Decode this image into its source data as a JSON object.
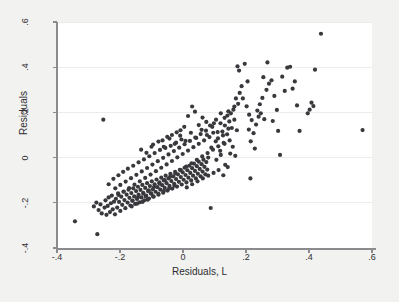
{
  "chart_data": {
    "type": "scatter",
    "title": "",
    "xlabel": "Residuals, L",
    "ylabel": "Residuals",
    "xlim": [
      -0.4,
      0.6
    ],
    "ylim": [
      -0.4,
      0.6
    ],
    "xticks": [
      -0.4,
      -0.2,
      0,
      0.2,
      0.4,
      0.6
    ],
    "xticklabels": [
      "-.4",
      "-.2",
      "0",
      ".2",
      ".4",
      ".6"
    ],
    "yticks": [
      -0.4,
      -0.2,
      0,
      0.2,
      0.4,
      0.6
    ],
    "yticklabels": [
      "-.4",
      "-.2",
      "0",
      ".2",
      ".4",
      ".6"
    ],
    "grid": "horizontal-faint",
    "legend": null,
    "marker_color": "#39393d",
    "marker_size_px": 4.2,
    "n_points": 296,
    "points": [
      [
        -0.343,
        -0.282
      ],
      [
        -0.272,
        -0.339
      ],
      [
        -0.253,
        0.168
      ],
      [
        -0.283,
        -0.216
      ],
      [
        -0.275,
        -0.199
      ],
      [
        -0.268,
        -0.232
      ],
      [
        -0.262,
        -0.207
      ],
      [
        -0.258,
        -0.247
      ],
      [
        -0.249,
        -0.221
      ],
      [
        -0.246,
        -0.189
      ],
      [
        -0.243,
        -0.253
      ],
      [
        -0.239,
        -0.214
      ],
      [
        -0.236,
        -0.176
      ],
      [
        -0.232,
        -0.241
      ],
      [
        -0.229,
        -0.202
      ],
      [
        -0.226,
        -0.168
      ],
      [
        -0.223,
        -0.229
      ],
      [
        -0.219,
        -0.195
      ],
      [
        -0.216,
        -0.251
      ],
      [
        -0.213,
        -0.182
      ],
      [
        -0.209,
        -0.221
      ],
      [
        -0.206,
        -0.158
      ],
      [
        -0.203,
        -0.196
      ],
      [
        -0.199,
        -0.236
      ],
      [
        -0.196,
        -0.173
      ],
      [
        -0.193,
        -0.209
      ],
      [
        -0.189,
        -0.151
      ],
      [
        -0.186,
        -0.188
      ],
      [
        -0.183,
        -0.224
      ],
      [
        -0.179,
        -0.164
      ],
      [
        -0.176,
        -0.199
      ],
      [
        -0.173,
        -0.142
      ],
      [
        -0.17,
        -0.178
      ],
      [
        -0.167,
        -0.212
      ],
      [
        -0.164,
        -0.157
      ],
      [
        -0.161,
        -0.191
      ],
      [
        -0.158,
        -0.136
      ],
      [
        -0.155,
        -0.172
      ],
      [
        -0.152,
        -0.205
      ],
      [
        -0.149,
        -0.148
      ],
      [
        -0.146,
        -0.183
      ],
      [
        -0.143,
        -0.129
      ],
      [
        -0.141,
        -0.164
      ],
      [
        -0.138,
        -0.198
      ],
      [
        -0.135,
        -0.143
      ],
      [
        -0.132,
        -0.176
      ],
      [
        -0.129,
        -0.121
      ],
      [
        -0.126,
        -0.156
      ],
      [
        -0.123,
        -0.189
      ],
      [
        -0.12,
        -0.134
      ],
      [
        -0.117,
        -0.168
      ],
      [
        -0.114,
        -0.113
      ],
      [
        -0.111,
        -0.148
      ],
      [
        -0.108,
        -0.181
      ],
      [
        -0.105,
        -0.126
      ],
      [
        -0.102,
        -0.159
      ],
      [
        -0.099,
        -0.105
      ],
      [
        -0.096,
        -0.14
      ],
      [
        -0.093,
        -0.173
      ],
      [
        -0.09,
        -0.118
      ],
      [
        -0.087,
        -0.151
      ],
      [
        -0.084,
        -0.097
      ],
      [
        -0.081,
        -0.131
      ],
      [
        -0.078,
        -0.164
      ],
      [
        -0.075,
        -0.109
      ],
      [
        -0.072,
        -0.142
      ],
      [
        -0.069,
        -0.089
      ],
      [
        -0.066,
        -0.122
      ],
      [
        -0.063,
        -0.155
      ],
      [
        -0.061,
        -0.101
      ],
      [
        -0.058,
        -0.134
      ],
      [
        -0.055,
        -0.08
      ],
      [
        -0.052,
        -0.113
      ],
      [
        -0.049,
        -0.146
      ],
      [
        -0.046,
        -0.092
      ],
      [
        -0.043,
        -0.125
      ],
      [
        -0.04,
        -0.072
      ],
      [
        -0.037,
        -0.104
      ],
      [
        -0.034,
        -0.137
      ],
      [
        -0.031,
        -0.083
      ],
      [
        -0.028,
        -0.116
      ],
      [
        -0.025,
        -0.063
      ],
      [
        -0.022,
        -0.095
      ],
      [
        -0.019,
        -0.128
      ],
      [
        -0.016,
        -0.074
      ],
      [
        -0.013,
        -0.107
      ],
      [
        -0.01,
        -0.054
      ],
      [
        -0.007,
        -0.086
      ],
      [
        -0.004,
        -0.119
      ],
      [
        -0.001,
        -0.065
      ],
      [
        0.002,
        -0.098
      ],
      [
        0.005,
        -0.045
      ],
      [
        0.008,
        -0.077
      ],
      [
        0.011,
        -0.11
      ],
      [
        0.014,
        -0.056
      ],
      [
        0.017,
        -0.089
      ],
      [
        0.02,
        -0.036
      ],
      [
        0.023,
        -0.068
      ],
      [
        0.026,
        -0.101
      ],
      [
        0.029,
        -0.047
      ],
      [
        0.032,
        -0.08
      ],
      [
        0.035,
        -0.027
      ],
      [
        0.038,
        -0.059
      ],
      [
        0.041,
        -0.092
      ],
      [
        0.044,
        -0.038
      ],
      [
        0.047,
        -0.071
      ],
      [
        0.05,
        -0.018
      ],
      [
        0.053,
        -0.05
      ],
      [
        0.056,
        -0.083
      ],
      [
        0.059,
        -0.029
      ],
      [
        0.062,
        -0.062
      ],
      [
        0.065,
        -0.009
      ],
      [
        0.068,
        -0.041
      ],
      [
        0.071,
        -0.074
      ],
      [
        0.074,
        -0.02
      ],
      [
        0.077,
        -0.053
      ],
      [
        0.08,
        0.0
      ],
      [
        -0.215,
        -0.136
      ],
      [
        -0.199,
        -0.121
      ],
      [
        -0.182,
        -0.106
      ],
      [
        -0.165,
        -0.091
      ],
      [
        -0.148,
        -0.076
      ],
      [
        -0.131,
        -0.061
      ],
      [
        -0.114,
        -0.046
      ],
      [
        -0.097,
        -0.031
      ],
      [
        -0.08,
        -0.016
      ],
      [
        -0.063,
        -0.001
      ],
      [
        -0.046,
        0.014
      ],
      [
        -0.029,
        0.029
      ],
      [
        -0.012,
        0.044
      ],
      [
        0.005,
        0.059
      ],
      [
        0.022,
        0.074
      ],
      [
        0.039,
        0.089
      ],
      [
        0.056,
        0.104
      ],
      [
        0.073,
        0.119
      ],
      [
        -0.205,
        -0.165
      ],
      [
        -0.188,
        -0.15
      ],
      [
        -0.171,
        -0.135
      ],
      [
        -0.154,
        -0.12
      ],
      [
        -0.137,
        -0.105
      ],
      [
        -0.12,
        -0.09
      ],
      [
        -0.103,
        -0.075
      ],
      [
        -0.086,
        -0.06
      ],
      [
        -0.069,
        -0.045
      ],
      [
        -0.052,
        -0.03
      ],
      [
        -0.035,
        -0.015
      ],
      [
        -0.018,
        0.001
      ],
      [
        -0.001,
        0.016
      ],
      [
        0.016,
        0.031
      ],
      [
        0.033,
        0.046
      ],
      [
        0.05,
        0.061
      ],
      [
        0.067,
        0.076
      ],
      [
        0.084,
        0.091
      ],
      [
        -0.16,
        -0.19
      ],
      [
        -0.143,
        -0.175
      ],
      [
        -0.126,
        -0.16
      ],
      [
        -0.109,
        -0.145
      ],
      [
        -0.092,
        -0.13
      ],
      [
        -0.075,
        -0.115
      ],
      [
        -0.058,
        -0.1
      ],
      [
        -0.041,
        -0.085
      ],
      [
        -0.024,
        -0.07
      ],
      [
        -0.007,
        -0.055
      ],
      [
        0.01,
        -0.04
      ],
      [
        0.027,
        -0.025
      ],
      [
        0.044,
        -0.01
      ],
      [
        0.061,
        0.005
      ],
      [
        0.078,
        0.02
      ],
      [
        0.095,
        0.035
      ],
      [
        0.112,
        0.05
      ],
      [
        0.129,
        0.065
      ],
      [
        -0.095,
        0.058
      ],
      [
        -0.078,
        0.071
      ],
      [
        -0.061,
        0.048
      ],
      [
        -0.043,
        0.084
      ],
      [
        -0.026,
        0.061
      ],
      [
        -0.009,
        0.097
      ],
      [
        0.008,
        0.074
      ],
      [
        0.025,
        0.11
      ],
      [
        0.042,
        0.087
      ],
      [
        0.059,
        0.123
      ],
      [
        0.076,
        0.1
      ],
      [
        0.093,
        0.136
      ],
      [
        0.11,
        0.113
      ],
      [
        0.127,
        0.098
      ],
      [
        0.144,
        0.128
      ],
      [
        0.09,
        0.044
      ],
      [
        0.104,
        0.072
      ],
      [
        0.118,
        0.03
      ],
      [
        0.096,
        0.11
      ],
      [
        0.111,
        0.085
      ],
      [
        0.125,
        0.115
      ],
      [
        0.132,
        0.061
      ],
      [
        0.14,
        0.103
      ],
      [
        0.148,
        0.076
      ],
      [
        0.106,
        -0.01
      ],
      [
        0.12,
        0.012
      ],
      [
        0.134,
        -0.032
      ],
      [
        0.113,
        -0.055
      ],
      [
        0.128,
        -0.078
      ],
      [
        0.142,
        -0.042
      ],
      [
        0.15,
        0.018
      ],
      [
        0.158,
        0.048
      ],
      [
        0.166,
        0.008
      ],
      [
        0.133,
        0.142
      ],
      [
        0.147,
        0.16
      ],
      [
        0.119,
        0.152
      ],
      [
        0.155,
        0.131
      ],
      [
        0.163,
        0.168
      ],
      [
        0.171,
        0.121
      ],
      [
        0.141,
        0.186
      ],
      [
        0.152,
        0.196
      ],
      [
        0.16,
        0.212
      ],
      [
        0.088,
        -0.223
      ],
      [
        0.214,
        -0.092
      ],
      [
        0.175,
        0.238
      ],
      [
        0.168,
        0.262
      ],
      [
        0.18,
        0.286
      ],
      [
        0.163,
        0.226
      ],
      [
        0.186,
        0.316
      ],
      [
        0.178,
        0.385
      ],
      [
        0.173,
        0.404
      ],
      [
        0.196,
        0.415
      ],
      [
        0.205,
        0.337
      ],
      [
        0.19,
        0.262
      ],
      [
        0.202,
        0.227
      ],
      [
        0.21,
        0.19
      ],
      [
        0.218,
        0.166
      ],
      [
        0.209,
        0.124
      ],
      [
        0.224,
        0.108
      ],
      [
        0.232,
        0.146
      ],
      [
        0.24,
        0.181
      ],
      [
        0.215,
        0.072
      ],
      [
        0.228,
        0.04
      ],
      [
        0.236,
        0.208
      ],
      [
        0.244,
        0.236
      ],
      [
        0.252,
        0.264
      ],
      [
        0.247,
        0.196
      ],
      [
        0.258,
        0.17
      ],
      [
        0.265,
        0.3
      ],
      [
        0.273,
        0.327
      ],
      [
        0.268,
        0.421
      ],
      [
        0.281,
        0.342
      ],
      [
        0.255,
        0.356
      ],
      [
        0.29,
        0.273
      ],
      [
        0.298,
        0.211
      ],
      [
        0.285,
        0.162
      ],
      [
        0.302,
        0.118
      ],
      [
        0.308,
        0.012
      ],
      [
        0.315,
        0.358
      ],
      [
        0.323,
        0.295
      ],
      [
        0.331,
        0.398
      ],
      [
        0.34,
        0.402
      ],
      [
        0.348,
        0.305
      ],
      [
        0.355,
        0.337
      ],
      [
        0.362,
        0.231
      ],
      [
        0.37,
        0.118
      ],
      [
        0.396,
        0.196
      ],
      [
        0.402,
        0.212
      ],
      [
        0.408,
        0.243
      ],
      [
        0.414,
        0.228
      ],
      [
        0.419,
        0.389
      ],
      [
        0.438,
        0.548
      ],
      [
        0.57,
        0.122
      ],
      [
        -0.236,
        -0.118
      ],
      [
        -0.221,
        -0.094
      ],
      [
        -0.19,
        -0.063
      ],
      [
        -0.175,
        -0.049
      ],
      [
        -0.205,
        -0.078
      ],
      [
        -0.158,
        -0.036
      ],
      [
        -0.141,
        -0.021
      ],
      [
        -0.124,
        -0.008
      ],
      [
        -0.107,
        0.006
      ],
      [
        -0.09,
        0.02
      ],
      [
        -0.073,
        0.034
      ],
      [
        -0.056,
        0.043
      ],
      [
        -0.039,
        0.052
      ],
      [
        -0.022,
        0.066
      ],
      [
        -0.005,
        0.08
      ],
      [
        -0.163,
        -0.216
      ],
      [
        -0.146,
        -0.204
      ],
      [
        -0.129,
        -0.196
      ],
      [
        -0.112,
        -0.186
      ],
      [
        -0.095,
        -0.172
      ],
      [
        -0.078,
        -0.16
      ],
      [
        -0.061,
        -0.148
      ],
      [
        -0.044,
        -0.136
      ],
      [
        -0.027,
        -0.124
      ],
      [
        0.012,
        -0.132
      ],
      [
        0.029,
        -0.118
      ],
      [
        0.046,
        -0.105
      ],
      [
        0.063,
        -0.092
      ],
      [
        0.08,
        -0.08
      ],
      [
        0.097,
        -0.068
      ],
      [
        -0.133,
        0.035
      ],
      [
        -0.116,
        0.021
      ],
      [
        -0.1,
        0.048
      ],
      [
        -0.118,
        -0.172
      ],
      [
        -0.101,
        -0.158
      ],
      [
        0.098,
        0.152
      ],
      [
        0.105,
        0.168
      ],
      [
        0.086,
        0.142
      ],
      [
        0.074,
        0.158
      ],
      [
        0.062,
        0.177
      ],
      [
        0.05,
        0.144
      ],
      [
        0.038,
        0.203
      ],
      [
        0.029,
        0.226
      ],
      [
        0.016,
        0.184
      ],
      [
        -0.008,
        0.121
      ],
      [
        0.004,
        0.136
      ],
      [
        -0.02,
        0.112
      ],
      [
        -0.035,
        0.1
      ],
      [
        -0.05,
        0.092
      ],
      [
        -0.065,
        0.076
      ],
      [
        0.12,
        0.196
      ],
      [
        0.132,
        0.176
      ],
      [
        0.144,
        0.205
      ]
    ]
  },
  "axis": {
    "x_title": "Residuals, L",
    "y_title": "Residuals"
  }
}
